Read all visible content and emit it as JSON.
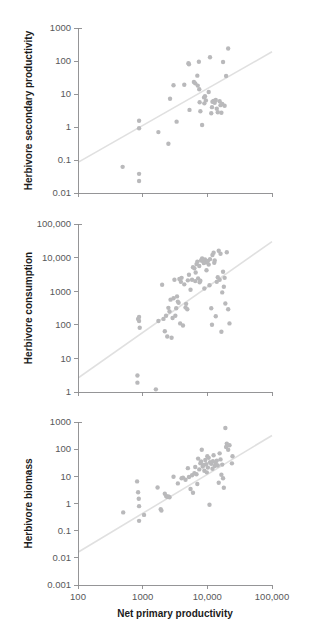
{
  "figure": {
    "background_color": "#ffffff",
    "point_color": "#b9b9bb",
    "line_color": "#e0e0e0",
    "axis_color": "#8a8a8c",
    "label_color": "#58585a",
    "title_color": "#1b1b1b",
    "cropped_top_text": "",
    "shared_xlabel": "Net primary productivity",
    "shared_xticks": [
      "100",
      "1000",
      "10,000",
      "100,000"
    ]
  },
  "chart_data": [
    {
      "type": "scatter",
      "panel": 1,
      "title": "",
      "xlabel": "",
      "ylabel": "Herbivore secondary productivity",
      "xscale": "log",
      "yscale": "log",
      "xlim": [
        100,
        100000
      ],
      "ylim": [
        0.01,
        1000
      ],
      "xticks": [
        "100",
        "1000",
        "10,000",
        "100,000"
      ],
      "xtick_values": [
        100,
        1000,
        10000,
        100000
      ],
      "yticks": [
        "0.01",
        "0.1",
        "1",
        "10",
        "100",
        "1000"
      ],
      "ytick_values": [
        0.01,
        0.1,
        1,
        10,
        100,
        1000
      ],
      "grid": false,
      "legend": "none",
      "trend_line": {
        "x": [
          100,
          100000
        ],
        "y": [
          0.085,
          190
        ]
      },
      "points": [
        [
          490,
          0.062
        ],
        [
          880,
          1.55
        ],
        [
          880,
          0.92
        ],
        [
          880,
          0.038
        ],
        [
          880,
          0.023
        ],
        [
          1750,
          0.7
        ],
        [
          2500,
          0.31
        ],
        [
          2650,
          7.2
        ],
        [
          3000,
          18.5
        ],
        [
          3350,
          1.45
        ],
        [
          4400,
          19.0
        ],
        [
          5200,
          80.0
        ],
        [
          5300,
          3.3
        ],
        [
          6200,
          23.0
        ],
        [
          6500,
          21.0
        ],
        [
          7000,
          36.0
        ],
        [
          7100,
          18.0
        ],
        [
          7400,
          95.0
        ],
        [
          7500,
          14.0
        ],
        [
          7600,
          5.6
        ],
        [
          7800,
          3.0
        ],
        [
          8300,
          1.15
        ],
        [
          8900,
          7.9
        ],
        [
          9000,
          5.2
        ],
        [
          9200,
          8.6
        ],
        [
          9500,
          6.4
        ],
        [
          10500,
          11.5
        ],
        [
          11000,
          130.0
        ],
        [
          11500,
          2.6
        ],
        [
          12000,
          5.8
        ],
        [
          12500,
          6.2
        ],
        [
          13000,
          5.4
        ],
        [
          13500,
          6.6
        ],
        [
          14000,
          3.6
        ],
        [
          14500,
          2.8
        ],
        [
          15500,
          6.0
        ],
        [
          16000,
          4.6
        ],
        [
          16500,
          2.7
        ],
        [
          17000,
          5.0
        ],
        [
          17500,
          93.0
        ],
        [
          18500,
          4.4
        ],
        [
          19500,
          35.0
        ],
        [
          21000,
          240.0
        ],
        [
          5100,
          86.0
        ],
        [
          11800,
          4.0
        ]
      ]
    },
    {
      "type": "scatter",
      "panel": 2,
      "title": "",
      "xlabel": "",
      "ylabel": "Herbivore consumption",
      "xscale": "log",
      "yscale": "log",
      "xlim": [
        100,
        100000
      ],
      "ylim": [
        1,
        100000
      ],
      "xticks": [
        "100",
        "1000",
        "10,000",
        "100,000"
      ],
      "xtick_values": [
        100,
        1000,
        10000,
        100000
      ],
      "yticks": [
        "1",
        "10",
        "100",
        "1000",
        "10,000",
        "100,000"
      ],
      "ytick_values": [
        1,
        10,
        100,
        1000,
        10000,
        100000
      ],
      "grid": false,
      "legend": "none",
      "trend_line": {
        "x": [
          100,
          100000
        ],
        "y": [
          2.6,
          30000
        ]
      },
      "points": [
        [
          830,
          3.1
        ],
        [
          830,
          1.9
        ],
        [
          850,
          150
        ],
        [
          880,
          170
        ],
        [
          880,
          130
        ],
        [
          900,
          82
        ],
        [
          1600,
          1.2
        ],
        [
          1750,
          130
        ],
        [
          2000,
          1550
        ],
        [
          2100,
          150
        ],
        [
          2200,
          64
        ],
        [
          2300,
          185
        ],
        [
          2400,
          45
        ],
        [
          2500,
          320
        ],
        [
          2600,
          250
        ],
        [
          2700,
          560
        ],
        [
          2800,
          41
        ],
        [
          2900,
          160
        ],
        [
          3000,
          620
        ],
        [
          3100,
          2200
        ],
        [
          3200,
          185
        ],
        [
          3300,
          310
        ],
        [
          3400,
          700
        ],
        [
          3500,
          490
        ],
        [
          3600,
          450
        ],
        [
          3700,
          2300
        ],
        [
          3800,
          110
        ],
        [
          3900,
          1900
        ],
        [
          4000,
          2500
        ],
        [
          4200,
          95
        ],
        [
          4400,
          1600
        ],
        [
          4600,
          330
        ],
        [
          4700,
          420
        ],
        [
          4900,
          290
        ],
        [
          5000,
          2100
        ],
        [
          5200,
          3100
        ],
        [
          5500,
          1100
        ],
        [
          5800,
          2200
        ],
        [
          6000,
          5200
        ],
        [
          6300,
          4800
        ],
        [
          6500,
          2000
        ],
        [
          6800,
          6400
        ],
        [
          7000,
          7500
        ],
        [
          7200,
          2400
        ],
        [
          7500,
          5600
        ],
        [
          7600,
          1850
        ],
        [
          7800,
          2050
        ],
        [
          8000,
          8200
        ],
        [
          8300,
          9500
        ],
        [
          8600,
          7800
        ],
        [
          8800,
          6900
        ],
        [
          9000,
          1200
        ],
        [
          9200,
          8800
        ],
        [
          9500,
          7200
        ],
        [
          9700,
          4200
        ],
        [
          10000,
          7600
        ],
        [
          10500,
          6200
        ],
        [
          10800,
          1500
        ],
        [
          11000,
          9000
        ],
        [
          11500,
          310
        ],
        [
          11800,
          100
        ],
        [
          12000,
          12000
        ],
        [
          12500,
          14000
        ],
        [
          13000,
          8200
        ],
        [
          13500,
          180
        ],
        [
          14000,
          1900
        ],
        [
          14500,
          2600
        ],
        [
          15000,
          16000
        ],
        [
          15500,
          2200
        ],
        [
          16000,
          13000
        ],
        [
          16500,
          62
        ],
        [
          17000,
          920
        ],
        [
          17500,
          3800
        ],
        [
          18000,
          1350
        ],
        [
          18500,
          2500
        ],
        [
          19000,
          430
        ],
        [
          20000,
          14500
        ],
        [
          21000,
          290
        ],
        [
          22000,
          110
        ],
        [
          6600,
          3600
        ],
        [
          10200,
          8000
        ],
        [
          12800,
          7000
        ]
      ]
    },
    {
      "type": "scatter",
      "panel": 3,
      "title": "",
      "xlabel": "Net primary productivity",
      "ylabel": "Herbivore biomass",
      "xscale": "log",
      "yscale": "log",
      "xlim": [
        100,
        100000
      ],
      "ylim": [
        0.001,
        1000
      ],
      "xticks": [
        "100",
        "1000",
        "10,000",
        "100,000"
      ],
      "xtick_values": [
        100,
        1000,
        10000,
        100000
      ],
      "yticks": [
        "0.001",
        "0.01",
        "0.1",
        "1",
        "10",
        "100",
        "1000"
      ],
      "ytick_values": [
        0.001,
        0.01,
        0.1,
        1,
        10,
        100,
        1000
      ],
      "grid": false,
      "legend": "none",
      "trend_line": {
        "x": [
          100,
          100000
        ],
        "y": [
          0.016,
          320
        ]
      },
      "points": [
        [
          500,
          0.47
        ],
        [
          820,
          6.5
        ],
        [
          850,
          2.6
        ],
        [
          870,
          1.5
        ],
        [
          880,
          0.8
        ],
        [
          880,
          0.23
        ],
        [
          1050,
          0.38
        ],
        [
          1700,
          3.9
        ],
        [
          1900,
          0.62
        ],
        [
          1950,
          0.55
        ],
        [
          2200,
          2.3
        ],
        [
          2300,
          1.9
        ],
        [
          2400,
          1.75
        ],
        [
          2500,
          1.8
        ],
        [
          2600,
          1.7
        ],
        [
          3000,
          9.6
        ],
        [
          3500,
          5.5
        ],
        [
          4000,
          8.5
        ],
        [
          4200,
          9.0
        ],
        [
          4600,
          7.5
        ],
        [
          5000,
          20.0
        ],
        [
          5200,
          9.5
        ],
        [
          5500,
          3.4
        ],
        [
          5800,
          11.0
        ],
        [
          6000,
          2.5
        ],
        [
          6300,
          13.0
        ],
        [
          6500,
          22.0
        ],
        [
          6800,
          12.0
        ],
        [
          7000,
          5.2
        ],
        [
          7200,
          45.0
        ],
        [
          7500,
          18.0
        ],
        [
          7800,
          30.0
        ],
        [
          8000,
          35.0
        ],
        [
          8200,
          95.0
        ],
        [
          8500,
          23.0
        ],
        [
          8800,
          26.0
        ],
        [
          9000,
          16.0
        ],
        [
          9300,
          40.0
        ],
        [
          9600,
          28.0
        ],
        [
          10000,
          55.0
        ],
        [
          10200,
          21.0
        ],
        [
          10500,
          48.0
        ],
        [
          10800,
          0.9
        ],
        [
          11000,
          33.0
        ],
        [
          11500,
          29.0
        ],
        [
          12000,
          19.0
        ],
        [
          12500,
          60.0
        ],
        [
          13000,
          24.0
        ],
        [
          13500,
          31.0
        ],
        [
          14000,
          38.0
        ],
        [
          14500,
          25.0
        ],
        [
          15000,
          5.8
        ],
        [
          15500,
          70.0
        ],
        [
          16000,
          42.0
        ],
        [
          16500,
          11.5
        ],
        [
          17000,
          27.0
        ],
        [
          17500,
          8.5
        ],
        [
          18000,
          3.8
        ],
        [
          19000,
          600.0
        ],
        [
          19500,
          120.0
        ],
        [
          20000,
          160.0
        ],
        [
          21000,
          95.0
        ],
        [
          22000,
          140.0
        ],
        [
          24000,
          30.0
        ],
        [
          24500,
          55.0
        ],
        [
          9800,
          14.0
        ],
        [
          12200,
          36.0
        ]
      ]
    }
  ]
}
